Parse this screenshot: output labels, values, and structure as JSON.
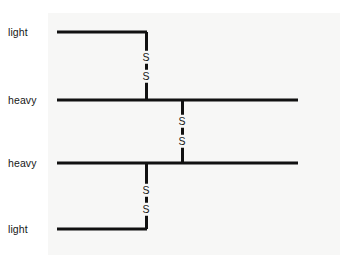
{
  "figure": {
    "width": 352,
    "height": 265,
    "background_color": "#ffffff",
    "panel_color": "#f7f7f6",
    "line_color": "#111111",
    "text_color": "#161616",
    "diagram_type": "antibody-chain-schematic"
  },
  "labels": [
    {
      "text": "light",
      "x": 8,
      "y": 32
    },
    {
      "text": "heavy",
      "x": 8,
      "y": 100
    },
    {
      "text": "heavy",
      "x": 8,
      "y": 163
    },
    {
      "text": "light",
      "x": 8,
      "y": 229
    }
  ],
  "chains": [
    {
      "name": "light-chain-top",
      "x1": 57,
      "x2": 147,
      "y": 32
    },
    {
      "name": "heavy-chain-upper",
      "x1": 57,
      "x2": 298,
      "y": 100
    },
    {
      "name": "heavy-chain-lower",
      "x1": 57,
      "x2": 298,
      "y": 163
    },
    {
      "name": "light-chain-bottom",
      "x1": 57,
      "x2": 147,
      "y": 229
    }
  ],
  "bridges": [
    {
      "name": "disulfide-bridge-upper-light-heavy",
      "x": 146,
      "y_top": 32,
      "y_bottom": 100,
      "sulfur_top_y": 57,
      "sulfur_bottom_y": 76,
      "sulfur_label": "S"
    },
    {
      "name": "disulfide-bridge-interchain-heavy-heavy",
      "x": 182,
      "y_top": 100,
      "y_bottom": 163,
      "sulfur_top_y": 121,
      "sulfur_bottom_y": 141,
      "sulfur_label": "S"
    },
    {
      "name": "disulfide-bridge-lower-heavy-light",
      "x": 146,
      "y_top": 163,
      "y_bottom": 229,
      "sulfur_top_y": 190,
      "sulfur_bottom_y": 209,
      "sulfur_label": "S"
    }
  ]
}
